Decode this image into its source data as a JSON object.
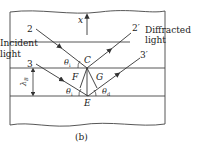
{
  "diagram": {
    "caption": "(b)",
    "axis_label": "x",
    "rays": {
      "incident_2": "2",
      "incident_3": "3",
      "diffracted_2": "2′",
      "diffracted_3": "3′"
    },
    "text": {
      "incident_line1": "Incident",
      "incident_line2": "light",
      "diffracted_line1": "Diffracted",
      "diffracted_line2": "light"
    },
    "points": {
      "C": "C",
      "F": "F",
      "G": "G",
      "E": "E"
    },
    "angles": {
      "theta_i_top": "θ",
      "theta_i_top_sub": "i",
      "theta_i_bottom": "θ",
      "theta_i_bottom_sub": "i",
      "theta_d": "θ",
      "theta_d_sub": "d"
    },
    "spacing_label": "λ",
    "spacing_sub": "B",
    "colors": {
      "line": "#333333",
      "background": "#ffffff"
    }
  }
}
